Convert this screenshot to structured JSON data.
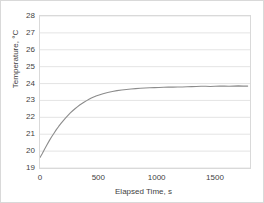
{
  "chart_data": {
    "type": "line",
    "title": "",
    "xlabel": "Elapsed Time, s",
    "ylabel": "Temperature, °C",
    "xlim": [
      0,
      1800
    ],
    "ylim": [
      19,
      28
    ],
    "xticks": [
      0,
      500,
      1000,
      1500
    ],
    "xtick_labels": [
      "0",
      "500",
      "1000",
      "1500"
    ],
    "yticks": [
      19,
      20,
      21,
      22,
      23,
      24,
      25,
      26,
      27,
      28
    ],
    "ytick_labels": [
      "19",
      "20",
      "21",
      "22",
      "23",
      "24",
      "25",
      "26",
      "27",
      "28"
    ],
    "grid": "horizontal",
    "grid_color": "#d9d9d9",
    "legend": "none",
    "series": [
      {
        "name": "Temperature",
        "color": "#8c8c8c",
        "x": [
          0,
          20,
          40,
          60,
          80,
          100,
          120,
          140,
          160,
          180,
          200,
          220,
          240,
          260,
          280,
          300,
          320,
          340,
          360,
          380,
          400,
          420,
          440,
          460,
          480,
          500,
          540,
          580,
          620,
          660,
          700,
          740,
          780,
          820,
          860,
          900,
          940,
          980,
          1020,
          1060,
          1100,
          1140,
          1180,
          1220,
          1260,
          1300,
          1340,
          1380,
          1420,
          1460,
          1500,
          1540,
          1580,
          1620,
          1660,
          1700,
          1740,
          1780
        ],
        "y": [
          19.62,
          19.86,
          20.12,
          20.38,
          20.62,
          20.85,
          21.06,
          21.27,
          21.46,
          21.64,
          21.81,
          21.97,
          22.12,
          22.26,
          22.39,
          22.51,
          22.62,
          22.73,
          22.82,
          22.91,
          22.99,
          23.07,
          23.14,
          23.2,
          23.26,
          23.31,
          23.4,
          23.47,
          23.53,
          23.58,
          23.62,
          23.65,
          23.68,
          23.7,
          23.72,
          23.74,
          23.75,
          23.76,
          23.77,
          23.78,
          23.79,
          23.79,
          23.8,
          23.8,
          23.81,
          23.82,
          23.83,
          23.84,
          23.84,
          23.83,
          23.84,
          23.85,
          23.85,
          23.84,
          23.85,
          23.86,
          23.85,
          23.85
        ]
      }
    ]
  }
}
